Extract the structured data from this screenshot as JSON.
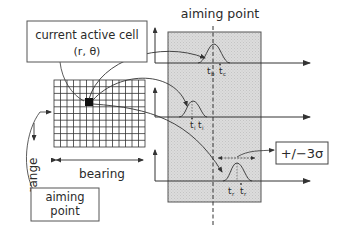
{
  "diagram": {
    "title_aiming_point": "aiming point",
    "cell_box": {
      "line1": "current active cell",
      "line2": "(r, θ)"
    },
    "axis_labels": {
      "range": "range",
      "bearing": "bearing"
    },
    "aiming_point_box": {
      "line1": "aiming",
      "line2": "point"
    },
    "sigma_box": "+/−3σ",
    "tracks": [
      {
        "label_a": "t",
        "sub_a": "b",
        "label_b": "t",
        "sub_b": "c"
      },
      {
        "label_a": "t",
        "sub_a": "i",
        "label_b": "t",
        "sub_b": "i"
      },
      {
        "label_a": "t",
        "sub_a": "r",
        "label_b": "t",
        "sub_b": "r"
      }
    ],
    "colors": {
      "panel": "#d9d9d9",
      "line": "#333333",
      "cell": "#111111"
    }
  }
}
